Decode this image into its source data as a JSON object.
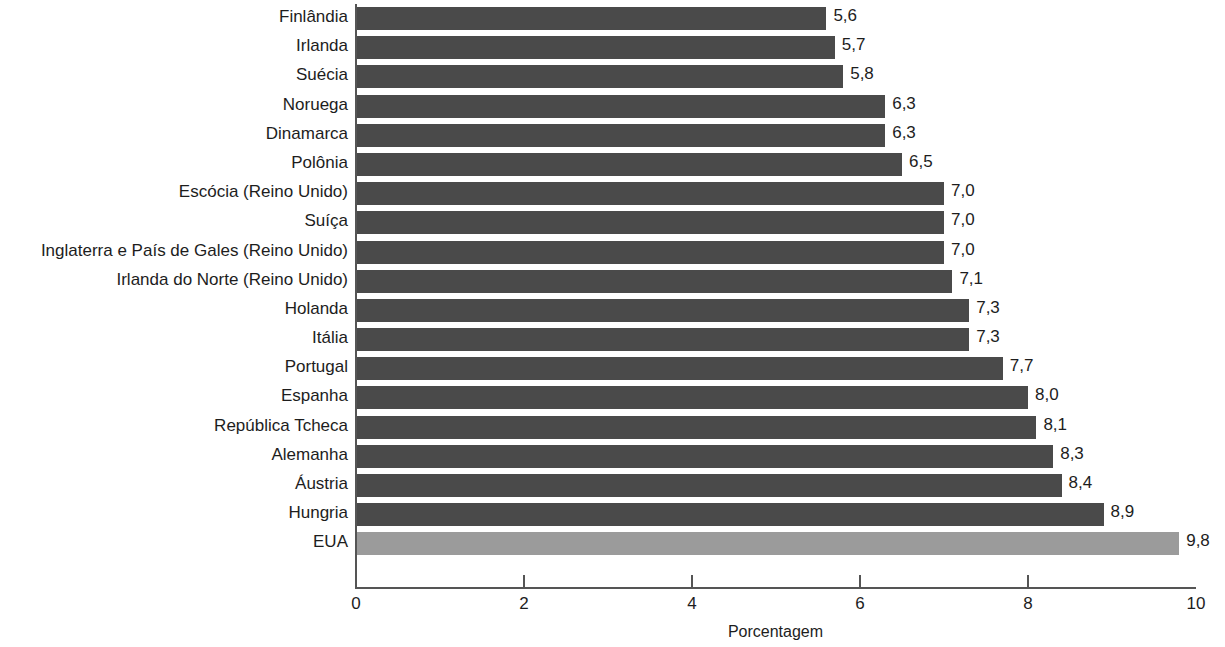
{
  "chart_data": {
    "type": "bar",
    "orientation": "horizontal",
    "title": "",
    "subtitle": "",
    "xlabel": "Porcentagem",
    "ylabel": "",
    "xlim": [
      0,
      10
    ],
    "xticks": [
      "0",
      "2",
      "4",
      "6",
      "8",
      "10"
    ],
    "xtick_values": [
      0,
      2,
      4,
      6,
      8,
      10
    ],
    "grid": false,
    "legend": "none",
    "categories": [
      "Finlândia",
      "Irlanda",
      "Suécia",
      "Noruega",
      "Dinamarca",
      "Polônia",
      "Escócia (Reino Unido)",
      "Suíça",
      "Inglaterra e País de Gales (Reino Unido)",
      "Irlanda do Norte (Reino Unido)",
      "Holanda",
      "Itália",
      "Portugal",
      "Espanha",
      "República Tcheca",
      "Alemanha",
      "Áustria",
      "Hungria",
      "EUA"
    ],
    "values": [
      5.6,
      5.7,
      5.8,
      6.3,
      6.3,
      6.5,
      7.0,
      7.0,
      7.0,
      7.1,
      7.3,
      7.3,
      7.7,
      8.0,
      8.1,
      8.3,
      8.4,
      8.9,
      9.8
    ],
    "value_labels": [
      "5,6",
      "5,7",
      "5,8",
      "6,3",
      "6,3",
      "6,5",
      "7,0",
      "7,0",
      "7,0",
      "7,1",
      "7,3",
      "7,3",
      "7,7",
      "8,0",
      "8,1",
      "8,3",
      "8,4",
      "8,9",
      "9,8"
    ],
    "highlight_category": "EUA",
    "colors": {
      "bar": "#4a4a4a",
      "bar_highlight": "#9b9b9b",
      "axis": "#555555",
      "text": "#1d1d1d",
      "background": "#ffffff"
    }
  }
}
